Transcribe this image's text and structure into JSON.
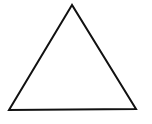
{
  "diagram": {
    "shape": "triangle",
    "vertices": [
      [
        72,
        5
      ],
      [
        9,
        110
      ],
      [
        136,
        109
      ]
    ],
    "stroke_color": "#111111",
    "fill_color": "#ffffff",
    "stroke_width": 2
  }
}
